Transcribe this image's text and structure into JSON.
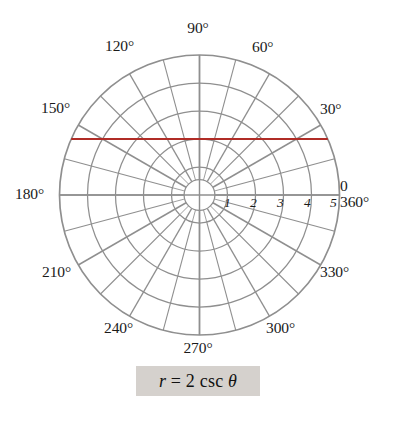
{
  "figure": {
    "kind": "polar-plot",
    "background_color": "#ffffff"
  },
  "chart_data": {
    "type": "line",
    "coordinate_system": "polar",
    "title": "",
    "equation": "r = 2 csc θ",
    "equation_parts": {
      "variable": "r",
      "equals": "=",
      "coefficient": "2",
      "function": "csc",
      "argument": "θ"
    },
    "curve_color": "#b02c26",
    "grid_color": "#8f8f8f",
    "axis_color": "#8f8f8f",
    "r_ticks": [
      1,
      2,
      3,
      4,
      5
    ],
    "r_tick_labels": [
      "1",
      "2",
      "3",
      "4",
      "5"
    ],
    "rlim": [
      0,
      5
    ],
    "r_grid_circles": [
      1,
      2,
      3,
      4,
      5
    ],
    "theta_grid_step_deg": 15,
    "theta_labeled_step_deg": 30,
    "theta_labels": [
      {
        "deg": 0,
        "text": "0",
        "text2": "360°"
      },
      {
        "deg": 30,
        "text": "30°"
      },
      {
        "deg": 60,
        "text": "60°"
      },
      {
        "deg": 90,
        "text": "90°"
      },
      {
        "deg": 120,
        "text": "120°"
      },
      {
        "deg": 150,
        "text": "150°"
      },
      {
        "deg": 180,
        "text": "180°"
      },
      {
        "deg": 210,
        "text": "210°"
      },
      {
        "deg": 240,
        "text": "240°"
      },
      {
        "deg": 270,
        "text": "270°"
      },
      {
        "deg": 300,
        "text": "300°"
      },
      {
        "deg": 330,
        "text": "330°"
      }
    ],
    "curve": {
      "name": "r = 2 csc θ",
      "cartesian_form": "y = 2",
      "y_value": 2,
      "x_range": [
        -5,
        5
      ],
      "points": [
        {
          "x": -4.58,
          "y": 2.0
        },
        {
          "x": 4.58,
          "y": 2.0
        }
      ]
    },
    "grid": true,
    "legend": null
  },
  "labels": {
    "angle": {
      "a0_line1": "0",
      "a0_line2": "360°",
      "a30": "30°",
      "a60": "60°",
      "a90": "90°",
      "a120": "120°",
      "a150": "150°",
      "a180": "180°",
      "a210": "210°",
      "a240": "240°",
      "a270": "270°",
      "a300": "300°",
      "a330": "330°"
    },
    "ticks": {
      "t1": "1",
      "t2": "2",
      "t3": "3",
      "t4": "4",
      "t5": "5"
    },
    "formula": {
      "var": "r",
      "eq": " = 2 csc ",
      "theta": "θ"
    }
  }
}
